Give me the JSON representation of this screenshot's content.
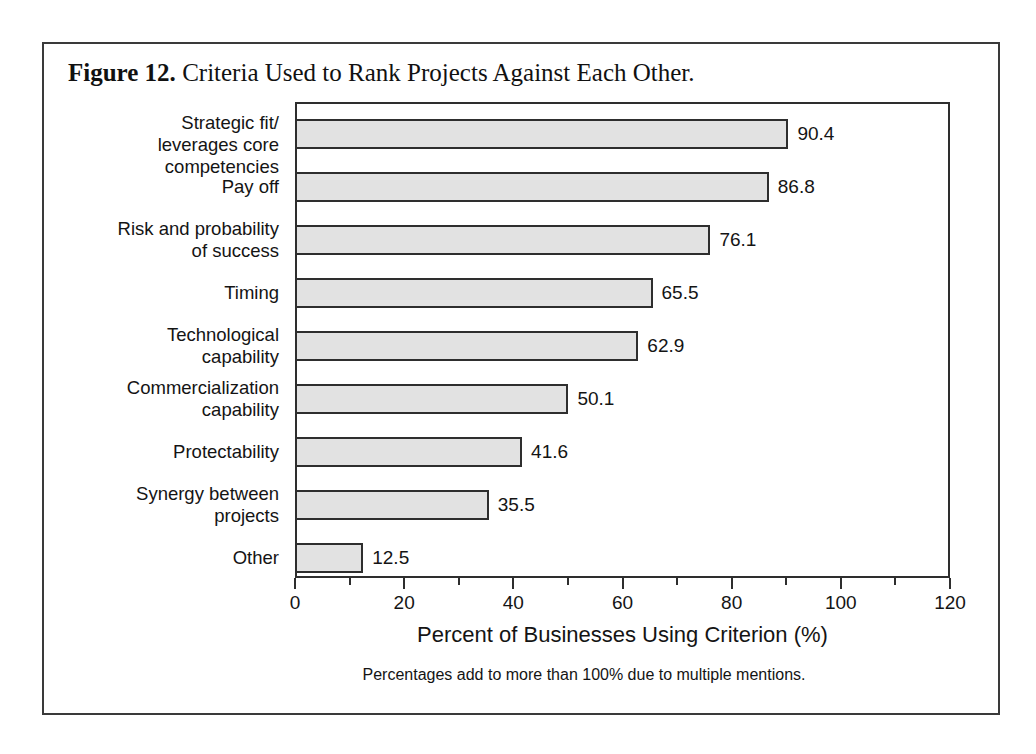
{
  "figure": {
    "number_label": "Figure 12.",
    "caption_text": "Criteria Used to Rank Projects Against Each Other.",
    "footnote": "Percentages add to more than 100% due to multiple mentions."
  },
  "chart_data": {
    "type": "bar",
    "orientation": "horizontal",
    "title": "Criteria Used to Rank Projects Against Each Other.",
    "xlabel": "Percent of Businesses Using Criterion (%)",
    "ylabel": "",
    "xlim": [
      0,
      120
    ],
    "xticks": [
      0,
      20,
      40,
      60,
      80,
      100,
      120
    ],
    "xticklabels": [
      "0",
      "20",
      "40",
      "60",
      "80",
      "100",
      "120"
    ],
    "minor_tick_step": 10,
    "grid": false,
    "legend": false,
    "bar_fill_color": "#e2e2e2",
    "bar_edge_color": "#2e2e2e",
    "categories": [
      "Strategic fit/\nleverages core competencies",
      "Pay off",
      "Risk and probability\nof success",
      "Timing",
      "Technological\ncapability",
      "Commercialization\ncapability",
      "Protectability",
      "Synergy between\nprojects",
      "Other"
    ],
    "values": [
      90.4,
      86.8,
      76.1,
      65.5,
      62.9,
      50.1,
      41.6,
      35.5,
      12.5
    ],
    "value_labels": [
      "90.4",
      "86.8",
      "76.1",
      "65.5",
      "62.9",
      "50.1",
      "41.6",
      "35.5",
      "12.5"
    ],
    "annotation": "Percentages add to more than 100% due to multiple mentions."
  }
}
